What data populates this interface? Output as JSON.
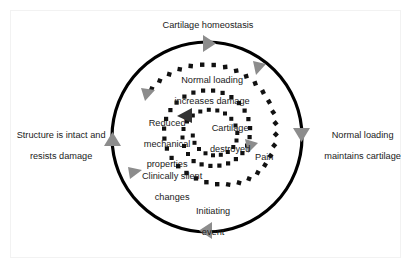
{
  "figure": {
    "colors": {
      "outer_circle": "#000000",
      "spiral_dots": "#111111",
      "arrow_gray": "#8c8c8c",
      "arrow_dark": "#333333",
      "text": "#1a1a1a",
      "frame": "#f2f2f2",
      "background": "#ffffff"
    }
  },
  "outer_cycle": {
    "name": "healthy-cartilage-cycle",
    "labels": {
      "top": "Cartilage homeostasis",
      "left_line1": "Structure is intact and",
      "left_line2": "resists damage",
      "right_line1": "Normal loading",
      "right_line2": "maintains cartilage",
      "bottom_line1": "Initiating",
      "bottom_line2": "event"
    },
    "arrows": [
      {
        "name": "arrow-top-right",
        "direction": "right",
        "color": "#8c8c8c"
      },
      {
        "name": "arrow-right-down",
        "direction": "down",
        "color": "#8c8c8c"
      },
      {
        "name": "arrow-bottom-left",
        "direction": "left",
        "color": "#8c8c8c"
      },
      {
        "name": "arrow-left-up",
        "direction": "up",
        "color": "#8c8c8c"
      }
    ]
  },
  "inner_spiral": {
    "name": "degeneration-spiral",
    "labels": {
      "top_line1": "Normal loading",
      "top_line2": "increases damage",
      "left_line1": "Reduced",
      "left_line2": "mechanical",
      "left_line3": "properties",
      "bottom_line1": "Clinically silent",
      "bottom_line2": "changes",
      "pain": "Pain",
      "center_line1": "Cartilage",
      "center_line2": "destroyed"
    },
    "arrows": [
      {
        "name": "spiral-arrow-upper-right",
        "direction": "down-right",
        "color": "#8c8c8c"
      },
      {
        "name": "spiral-arrow-left",
        "direction": "down-left",
        "color": "#8c8c8c"
      },
      {
        "name": "spiral-arrow-lower-left",
        "direction": "right",
        "color": "#8c8c8c"
      },
      {
        "name": "spiral-arrow-pain",
        "direction": "down-left",
        "color": "#8c8c8c"
      },
      {
        "name": "spiral-arrow-center",
        "direction": "left",
        "color": "#333333"
      }
    ]
  }
}
